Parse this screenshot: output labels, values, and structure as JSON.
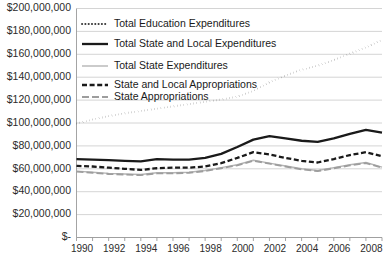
{
  "chart_data": {
    "type": "line",
    "title": "",
    "xlabel": "",
    "ylabel": "",
    "x": [
      1990,
      1991,
      1992,
      1993,
      1994,
      1995,
      1996,
      1997,
      1998,
      1999,
      2000,
      2001,
      2002,
      2003,
      2004,
      2005,
      2006,
      2007,
      2008,
      2009
    ],
    "xlim": [
      1990,
      2009
    ],
    "ylim": [
      0,
      200000000
    ],
    "grid": true,
    "legend_position": "top-left-inside",
    "xtick_labels": [
      "1990",
      "1992",
      "1994",
      "1996",
      "1998",
      "2000",
      "2002",
      "2004",
      "2006",
      "2008"
    ],
    "xtick_values": [
      1990,
      1992,
      1994,
      1996,
      1998,
      2000,
      2002,
      2004,
      2006,
      2008
    ],
    "ytick_labels": [
      "$-",
      "$20,000,000",
      "$40,000,000",
      "$60,000,000",
      "$80,000,000",
      "$100,000,000",
      "$120,000,000",
      "$140,000,000",
      "$160,000,000",
      "$180,000,000",
      "$200,000,000"
    ],
    "ytick_values": [
      0,
      20000000,
      40000000,
      60000000,
      80000000,
      100000000,
      120000000,
      140000000,
      160000000,
      180000000,
      200000000
    ],
    "series": [
      {
        "name": "Total Education Expenditures",
        "style": "dotted",
        "color": "#3a3a3a",
        "width": 1.9,
        "values": [
          99500000,
          103000000,
          106000000,
          108500000,
          110500000,
          112500000,
          114500000,
          116500000,
          118500000,
          120500000,
          123000000,
          128000000,
          135500000,
          141500000,
          146500000,
          150000000,
          155000000,
          160500000,
          166000000,
          172500000
        ]
      },
      {
        "name": "Total State and Local Expenditures",
        "style": "solid",
        "color": "#1a1a1a",
        "width": 2.3,
        "values": [
          68500000,
          68000000,
          67500000,
          67000000,
          66500000,
          68500000,
          68000000,
          68000000,
          69500000,
          73000000,
          79000000,
          85500000,
          88500000,
          86500000,
          84500000,
          83500000,
          86500000,
          90500000,
          94000000,
          91500000
        ]
      },
      {
        "name": "Total State Expenditures",
        "style": "solid-light",
        "color": "#b5b5b5",
        "width": 1.4,
        "values": [
          58000000,
          57000000,
          56000000,
          55500000,
          55000000,
          56500000,
          56500000,
          57000000,
          58500000,
          61000000,
          63500000,
          67500000,
          65000000,
          62500000,
          60000000,
          58500000,
          61000000,
          63500000,
          65500000,
          61500000
        ]
      },
      {
        "name": "State and Local Appropriations",
        "style": "dashed",
        "color": "#1a1a1a",
        "width": 2.3,
        "values": [
          62500000,
          62000000,
          61000000,
          60000000,
          59000000,
          60500000,
          61000000,
          61000000,
          62000000,
          65000000,
          69500000,
          74500000,
          72500000,
          69500000,
          67000000,
          65500000,
          68500000,
          72000000,
          74500000,
          71000000
        ]
      },
      {
        "name": "State Appropriations",
        "style": "long-dash-dot",
        "color": "#9d9d9d",
        "width": 1.9,
        "values": [
          57500000,
          56500000,
          55500000,
          55000000,
          54500000,
          56000000,
          56000000,
          56500000,
          58000000,
          60500000,
          63000000,
          67000000,
          64500000,
          62000000,
          59500000,
          58000000,
          60500000,
          63000000,
          65000000,
          61000000
        ]
      }
    ]
  },
  "legend": {
    "items": [
      {
        "label": "Total Education Expenditures"
      },
      {
        "label": "Total State and Local Expenditures"
      },
      {
        "label": "Total State Expenditures"
      },
      {
        "label": "State and Local Appropriations"
      },
      {
        "label": "State Appropriations"
      }
    ]
  },
  "colors": {
    "grid": "#c9c9c9",
    "axis": "#9a9a9a",
    "text": "#2b2b2b",
    "background": "#ffffff"
  }
}
